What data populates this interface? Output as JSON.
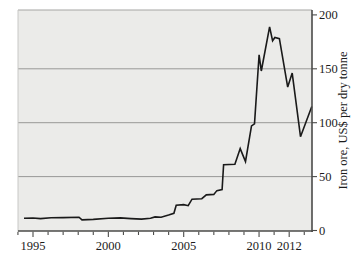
{
  "figure": {
    "width": 359,
    "height": 268,
    "background": "#ffffff",
    "plot_background": "#ebebe9",
    "grid_color": "#8f8f8d",
    "top_border_color": "#a6a6a4",
    "left_border_color": "#c8c8c6",
    "frame_color": "#4b4b49",
    "line_color": "#1a1a1a",
    "text_color": "#1c1c1c"
  },
  "chart_data": {
    "type": "line",
    "title": "",
    "xlabel": "",
    "ylabel": "Iron ore, US$ per dry tonne",
    "xlim": [
      1994.0,
      2013.55
    ],
    "ylim": [
      0,
      200
    ],
    "grid": "horizontal",
    "legend": "none",
    "x_axis": {
      "minor_tick_step_years": 1,
      "labeled_ticks": [
        {
          "year": 1995,
          "label": "1995"
        },
        {
          "year": 2000,
          "label": "2000"
        },
        {
          "year": 2005,
          "label": "2005"
        },
        {
          "year": 2010,
          "label": "2010"
        },
        {
          "year": 2012,
          "label": "2012"
        }
      ]
    },
    "y_axis": {
      "side": "right",
      "title": "Iron ore, US$ per dry tonne",
      "ticks": [
        {
          "value": 0,
          "label": "0"
        },
        {
          "value": 50,
          "label": "50"
        },
        {
          "value": 100,
          "label": "100"
        },
        {
          "value": 150,
          "label": "150"
        },
        {
          "value": 200,
          "label": "200"
        }
      ],
      "gridline_values": [
        50,
        100,
        150
      ]
    },
    "series": [
      {
        "name": "Iron ore price, US$ per dry tonne",
        "x": [
          1994.4,
          1995.0,
          1995.5,
          1996.2,
          1997.0,
          1998.05,
          1998.25,
          1999.0,
          2000.0,
          2000.8,
          2001.5,
          2002.2,
          2002.8,
          2003.1,
          2003.5,
          2004.0,
          2004.35,
          2004.5,
          2005.0,
          2005.3,
          2005.55,
          2006.2,
          2006.5,
          2007.0,
          2007.2,
          2007.55,
          2007.65,
          2008.4,
          2008.75,
          2009.1,
          2009.5,
          2009.7,
          2010.0,
          2010.15,
          2010.7,
          2010.9,
          2011.05,
          2011.35,
          2011.9,
          2012.2,
          2012.75,
          2013.5
        ],
        "values": [
          11.3,
          11.6,
          11.0,
          11.9,
          12.0,
          12.3,
          9.8,
          10.3,
          11.4,
          11.7,
          11.0,
          10.6,
          11.3,
          12.6,
          12.2,
          14.3,
          16.0,
          23.5,
          24.0,
          23.0,
          29.0,
          29.5,
          33.0,
          33.5,
          37.0,
          38.0,
          61.0,
          61.5,
          76.0,
          64.0,
          97.0,
          99.0,
          163.0,
          148.0,
          189.0,
          176.0,
          179.0,
          178.0,
          133.0,
          146.0,
          87.0,
          115.0
        ]
      }
    ]
  },
  "layout_values": {
    "plot_left": 18,
    "plot_top": 10,
    "plot_right": 312,
    "plot_bottom": 231,
    "y_of_zero": 230.5,
    "y_of_200": 14.9,
    "x_of_1995": 33.0,
    "px_per_year": 15.07
  }
}
